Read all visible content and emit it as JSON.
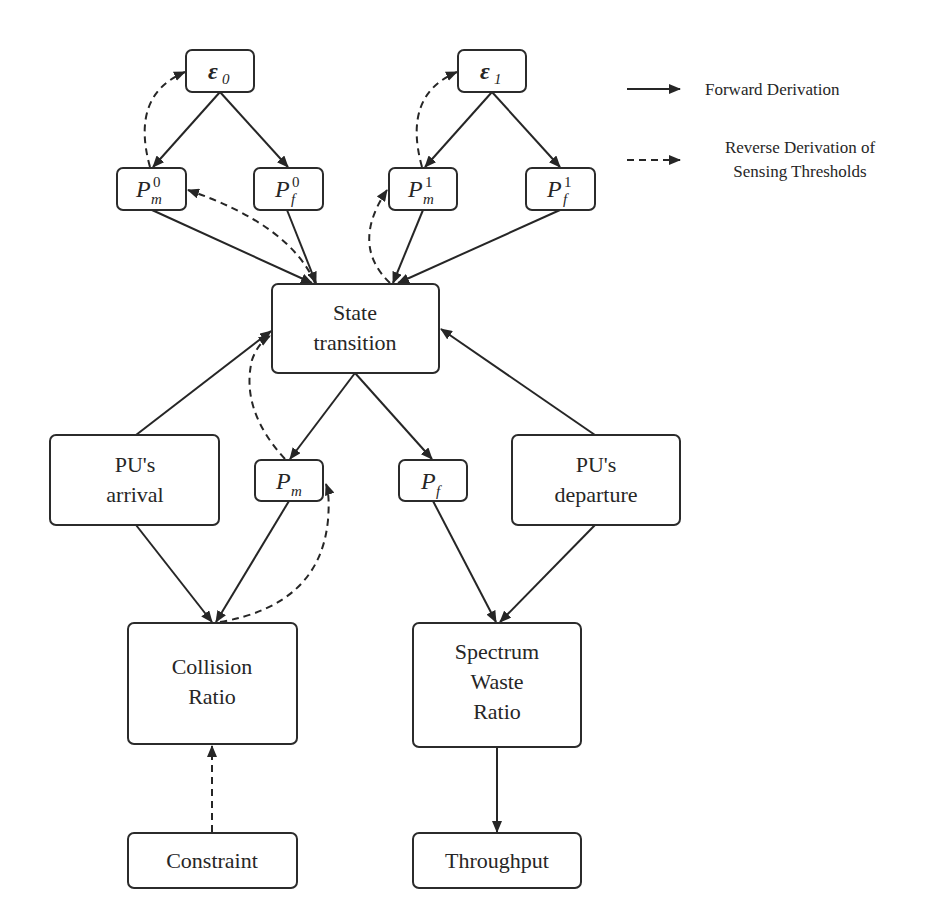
{
  "legend": {
    "forward": "Forward Derivation",
    "reverse_line1": "Reverse Derivation of",
    "reverse_line2": "Sensing Thresholds"
  },
  "nodes": {
    "eps0": {
      "symbol": "ε",
      "sub": "0"
    },
    "eps1": {
      "symbol": "ε",
      "sub": "1"
    },
    "pm0": {
      "symbol": "P",
      "sup": "0",
      "sub": "m"
    },
    "pf0": {
      "symbol": "P",
      "sup": "0",
      "sub": "f"
    },
    "pm1": {
      "symbol": "P",
      "sup": "1",
      "sub": "m"
    },
    "pf1": {
      "symbol": "P",
      "sup": "1",
      "sub": "f"
    },
    "state": {
      "line1": "State",
      "line2": "transition"
    },
    "arrival": {
      "line1": "PU's",
      "line2": "arrival"
    },
    "pm": {
      "symbol": "P",
      "sub": "m"
    },
    "pf": {
      "symbol": "P",
      "sub": "f"
    },
    "departure": {
      "line1": "PU's",
      "line2": "departure"
    },
    "collision": {
      "line1": "Collision",
      "line2": "Ratio"
    },
    "waste": {
      "line1": "Spectrum",
      "line2": "Waste",
      "line3": "Ratio"
    },
    "constraint": {
      "label": "Constraint"
    },
    "throughput": {
      "label": "Throughput"
    }
  },
  "edges": {
    "forward": [
      [
        "eps0",
        "pm0"
      ],
      [
        "eps0",
        "pf0"
      ],
      [
        "eps1",
        "pm1"
      ],
      [
        "eps1",
        "pf1"
      ],
      [
        "pm0",
        "state"
      ],
      [
        "pf0",
        "state"
      ],
      [
        "pm1",
        "state"
      ],
      [
        "pf1",
        "state"
      ],
      [
        "arrival",
        "state"
      ],
      [
        "departure",
        "state"
      ],
      [
        "state",
        "pm"
      ],
      [
        "state",
        "pf"
      ],
      [
        "arrival",
        "collision"
      ],
      [
        "pm",
        "collision"
      ],
      [
        "pf",
        "waste"
      ],
      [
        "departure",
        "waste"
      ],
      [
        "waste",
        "throughput"
      ]
    ],
    "reverse": [
      [
        "constraint",
        "collision"
      ],
      [
        "collision",
        "pm"
      ],
      [
        "pm",
        "state"
      ],
      [
        "state",
        "pm0"
      ],
      [
        "state",
        "pm1"
      ],
      [
        "pm0",
        "eps0"
      ],
      [
        "pm1",
        "eps1"
      ]
    ]
  }
}
